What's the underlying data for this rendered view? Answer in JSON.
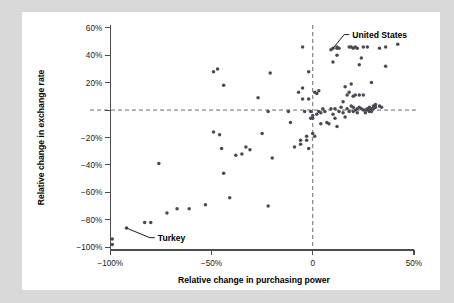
{
  "figure": {
    "background_color": "#d9d9d9",
    "card_color": "#ffffff",
    "point_color": "#4a4a52",
    "axis_color": "#4d4d4d",
    "reference_line_color": "#6b6b6b"
  },
  "chart_data": {
    "type": "scatter",
    "title": "",
    "xlabel": "Relative change in purchasing power",
    "ylabel": "Relative change in exchange rate",
    "xlim": [
      -110,
      52
    ],
    "ylim": [
      -102,
      62
    ],
    "grid": false,
    "legend": null,
    "xticks": [
      -100,
      -50,
      0,
      50
    ],
    "xticklabels": [
      "−100%",
      "−50%",
      "0",
      "50%"
    ],
    "yticks": [
      -100,
      -80,
      -60,
      -40,
      -20,
      0,
      20,
      40,
      60
    ],
    "yticklabels": [
      "−100%",
      "−80%",
      "−60%",
      "−40%",
      "−20%",
      "",
      "20%",
      "40%",
      "60%"
    ],
    "reference_lines": [
      {
        "axis": "y",
        "value": 0,
        "style": "dashed"
      },
      {
        "axis": "x",
        "value": 0,
        "style": "dashed"
      }
    ],
    "annotations": [
      {
        "label": "United States",
        "point_x": 10,
        "point_y": 45,
        "text_x": 18,
        "text_y": 55,
        "leader": true
      },
      {
        "label": "Turkey",
        "point_x": -92,
        "point_y": -86,
        "text_x": -78,
        "text_y": -93,
        "leader": true
      }
    ],
    "points": [
      [
        -99,
        -98
      ],
      [
        -99,
        -94
      ],
      [
        -92,
        -86
      ],
      [
        -83,
        -82
      ],
      [
        -80,
        -82
      ],
      [
        -76,
        -39
      ],
      [
        -72,
        -75
      ],
      [
        -67,
        -72
      ],
      [
        -61,
        -72
      ],
      [
        -53,
        -69
      ],
      [
        -49,
        28
      ],
      [
        -49,
        -16
      ],
      [
        -46,
        -18
      ],
      [
        -47,
        30
      ],
      [
        -45,
        -28
      ],
      [
        -44,
        18
      ],
      [
        -44,
        -46
      ],
      [
        -41,
        -64
      ],
      [
        -38,
        -33
      ],
      [
        -35,
        -32
      ],
      [
        -33,
        -27
      ],
      [
        -31,
        -29
      ],
      [
        -27,
        9
      ],
      [
        -25,
        -17
      ],
      [
        -22,
        -1
      ],
      [
        -22,
        -70
      ],
      [
        -21,
        27
      ],
      [
        -20,
        -35
      ],
      [
        -12,
        -1
      ],
      [
        -11,
        -9
      ],
      [
        -9,
        -27
      ],
      [
        -7,
        13
      ],
      [
        -6,
        -22
      ],
      [
        -6,
        -25
      ],
      [
        -5,
        16
      ],
      [
        -5,
        46
      ],
      [
        -5,
        8
      ],
      [
        -4,
        -1
      ],
      [
        -3,
        -19
      ],
      [
        -3,
        -22
      ],
      [
        -2,
        28
      ],
      [
        -2,
        8
      ],
      [
        -2,
        -28
      ],
      [
        -1,
        -1
      ],
      [
        -1,
        -6
      ],
      [
        0,
        -4
      ],
      [
        0,
        -6
      ],
      [
        0,
        -17
      ],
      [
        1,
        13
      ],
      [
        1,
        -19
      ],
      [
        2,
        12
      ],
      [
        2,
        -3
      ],
      [
        3,
        14
      ],
      [
        3,
        -1
      ],
      [
        4,
        -2
      ],
      [
        4,
        -10
      ],
      [
        5,
        1
      ],
      [
        6,
        -1
      ],
      [
        7,
        -9
      ],
      [
        8,
        -10
      ],
      [
        9,
        44
      ],
      [
        9,
        1
      ],
      [
        10,
        45
      ],
      [
        10,
        35
      ],
      [
        10,
        -3
      ],
      [
        11,
        1
      ],
      [
        11,
        -6
      ],
      [
        12,
        45
      ],
      [
        12,
        46
      ],
      [
        12,
        40
      ],
      [
        12,
        -12
      ],
      [
        13,
        45
      ],
      [
        13,
        -1
      ],
      [
        14,
        2
      ],
      [
        15,
        6
      ],
      [
        15,
        -2
      ],
      [
        16,
        17
      ],
      [
        16,
        -5
      ],
      [
        17,
        11
      ],
      [
        17,
        1
      ],
      [
        18,
        13
      ],
      [
        18,
        -1
      ],
      [
        18,
        46
      ],
      [
        19,
        19
      ],
      [
        19,
        46
      ],
      [
        19,
        3
      ],
      [
        20,
        10
      ],
      [
        20,
        45
      ],
      [
        20,
        2
      ],
      [
        20,
        -1
      ],
      [
        21,
        46
      ],
      [
        21,
        11
      ],
      [
        21,
        0
      ],
      [
        22,
        1
      ],
      [
        22,
        -2
      ],
      [
        22,
        45
      ],
      [
        23,
        11
      ],
      [
        23,
        33
      ],
      [
        23,
        2
      ],
      [
        24,
        38
      ],
      [
        24,
        1
      ],
      [
        25,
        46
      ],
      [
        25,
        11
      ],
      [
        25,
        0
      ],
      [
        26,
        0
      ],
      [
        26,
        -2
      ],
      [
        27,
        1
      ],
      [
        27,
        46
      ],
      [
        27,
        0
      ],
      [
        28,
        2
      ],
      [
        28,
        -1
      ],
      [
        28,
        0
      ],
      [
        29,
        20
      ],
      [
        29,
        1
      ],
      [
        29,
        -1
      ],
      [
        30,
        3
      ],
      [
        30,
        1
      ],
      [
        31,
        4
      ],
      [
        31,
        2
      ],
      [
        33,
        45
      ],
      [
        33,
        3
      ],
      [
        34,
        2
      ],
      [
        36,
        32
      ],
      [
        36,
        46
      ],
      [
        42,
        48
      ]
    ]
  }
}
